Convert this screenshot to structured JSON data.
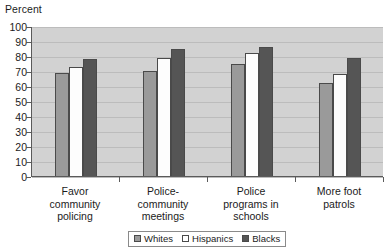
{
  "chart_data": {
    "type": "bar",
    "title": "",
    "xlabel": "",
    "ylabel": "Percent",
    "ylim": [
      0,
      100
    ],
    "ytick_step": 10,
    "grid": true,
    "legend_position": "bottom",
    "categories": [
      "Favor\ncommunity\npolicing",
      "Police-\ncommunity\nmeetings",
      "Police\nprograms in\nschools",
      "More foot\npatrols"
    ],
    "yticks": [
      "100",
      "90",
      "80",
      "70",
      "60",
      "50",
      "40",
      "30",
      "20",
      "10",
      "0"
    ],
    "series": [
      {
        "name": "Whites",
        "color": "#9a9a9a",
        "values": [
          69,
          70,
          75,
          62
        ]
      },
      {
        "name": "Hispanics",
        "color": "#ffffff",
        "values": [
          73,
          79,
          82,
          68
        ]
      },
      {
        "name": "Blacks",
        "color": "#555555",
        "values": [
          78,
          85,
          86,
          79
        ]
      }
    ]
  },
  "legend": {
    "items": [
      {
        "label": "Whites"
      },
      {
        "label": "Hispanics"
      },
      {
        "label": "Blacks"
      }
    ]
  }
}
